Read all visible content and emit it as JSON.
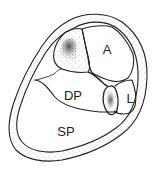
{
  "diagram": {
    "type": "cross-section",
    "labels": {
      "anterior": "A",
      "lateral": "L",
      "deep_posterior": "DP",
      "superficial_posterior": "SP"
    },
    "colors": {
      "line": "#222222",
      "background": "#ffffff",
      "stipple": "#555555"
    },
    "regions": [
      {
        "id": "outer-fascia-band",
        "fill": "stippled"
      },
      {
        "id": "tibia",
        "fill": "stippled-dense"
      },
      {
        "id": "fibula",
        "fill": "stippled-dense"
      },
      {
        "id": "anterior-compartment",
        "label": "A"
      },
      {
        "id": "lateral-compartment",
        "label": "L"
      },
      {
        "id": "deep-posterior-compartment",
        "label": "DP"
      },
      {
        "id": "superficial-posterior-compartment",
        "label": "SP"
      }
    ]
  }
}
